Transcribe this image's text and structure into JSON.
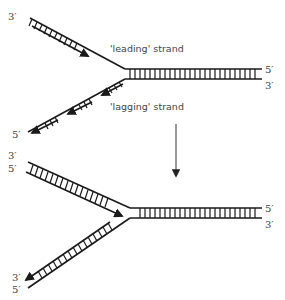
{
  "diagram": {
    "type": "DNA replication fork",
    "top_fork": {
      "labels": {
        "leading_strand": "'leading' strand",
        "lagging_strand": "'lagging' strand",
        "duplex_top_end": "5′",
        "duplex_bottom_end": "3′",
        "leading_arm_end": "3′",
        "lagging_arm_end": "5′"
      },
      "lagging_fragments": 3
    },
    "transition_arrow": "down",
    "bottom_fork": {
      "labels": {
        "upper_arm_end_top": "3′",
        "upper_arm_end_bottom": "5′",
        "duplex_top_end": "5′",
        "duplex_bottom_end": "3′",
        "lower_arm_end_top": "3′",
        "lower_arm_end_bottom": "5′"
      }
    },
    "colors": {
      "line": "#1a1a1a",
      "text": "#444444",
      "arrow": "#555555"
    }
  }
}
